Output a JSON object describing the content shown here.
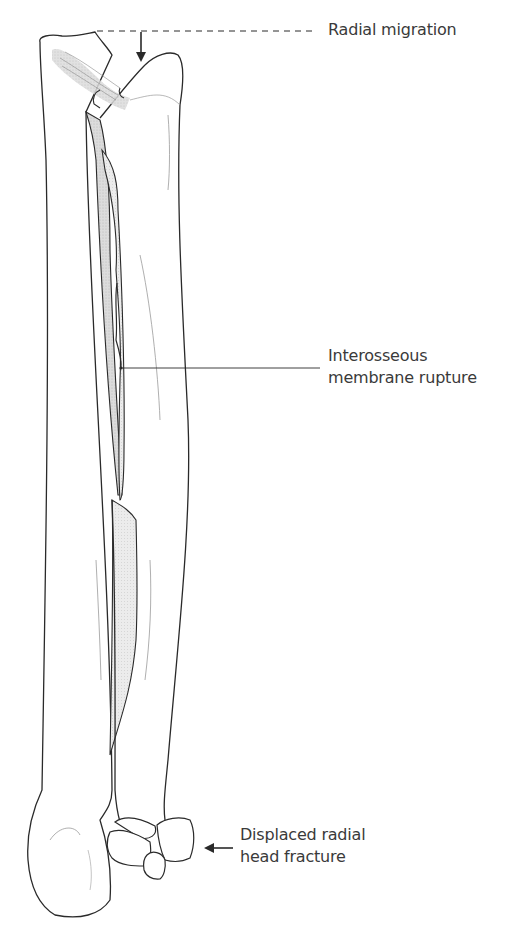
{
  "figure": {
    "type": "anatomical-illustration",
    "colors": {
      "outline": "#2a2a2a",
      "membrane_shade": "#d6d6d6",
      "ligament_shade": "#c8c8c8",
      "label_text": "#3a3a3a",
      "background": "#ffffff"
    }
  },
  "annotations": {
    "radial_migration": {
      "text": "Radial migration",
      "indicator": "dashed-line-with-down-arrow"
    },
    "interosseous": {
      "line1": "Interosseous",
      "line2": "membrane rupture",
      "indicator": "leader-line"
    },
    "radial_head": {
      "line1": "Displaced radial",
      "line2": "head fracture",
      "indicator": "left-arrow"
    }
  }
}
